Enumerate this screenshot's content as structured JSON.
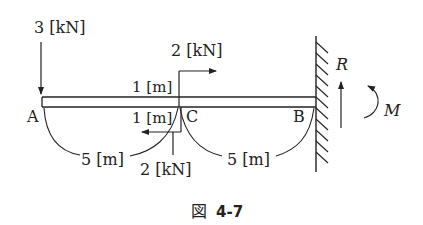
{
  "figure": {
    "caption_prefix": "図",
    "caption_number": "4-7"
  },
  "points": {
    "a": "A",
    "b": "B",
    "c": "C"
  },
  "loads": {
    "left_vertical_load": "3 [kN]",
    "upper_horizontal_load": "2 [kN]",
    "upper_arm": "1 [m]",
    "lower_arm": "1 [m]",
    "lower_vertical_load": "2 [kN]"
  },
  "spans": {
    "a_to_c": "5 [m]",
    "c_to_b": "5 [m]"
  },
  "reactions": {
    "force": "R",
    "moment": "M"
  },
  "colors": {
    "ink": "#222222",
    "background": "#ffffff"
  }
}
